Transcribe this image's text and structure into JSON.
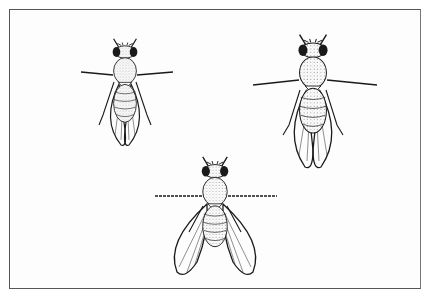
{
  "figure": {
    "subjects": [
      {
        "id": "fly-top-left",
        "pose": "wings folded over abdomen",
        "size": "small"
      },
      {
        "id": "fly-top-right",
        "pose": "wings folded over abdomen",
        "size": "large"
      },
      {
        "id": "fly-bottom-center",
        "pose": "wings spread outward",
        "size": "medium"
      }
    ],
    "colors": {
      "ink": "#1a1a1a",
      "background": "#ffffff",
      "frame": "#555555",
      "stipple": "#9a9a9a"
    }
  }
}
